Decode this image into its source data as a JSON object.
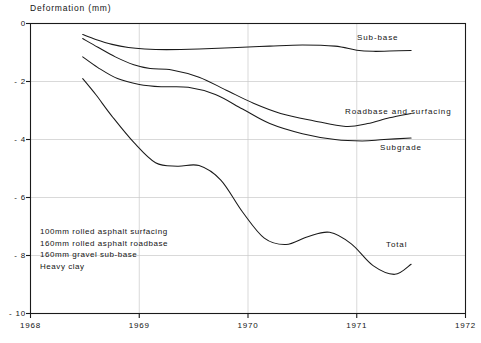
{
  "chart_data": {
    "type": "line",
    "title": "",
    "ylabel": "Deformation (mm)",
    "xlabel": "",
    "ylim": [
      -10,
      0
    ],
    "xlim": [
      1968,
      1972
    ],
    "yticks": [
      0,
      -2,
      -4,
      -6,
      -8,
      -10
    ],
    "ytick_labels": [
      "0",
      "- 2",
      "- 4",
      "- 6",
      "- 8",
      "- 10"
    ],
    "xticks": [
      1968,
      1969,
      1970,
      1971,
      1972
    ],
    "xtick_labels": [
      "1968",
      "1969",
      "1970",
      "1971",
      "1972"
    ],
    "grid": true,
    "legend_position": "inline-right-of-curve",
    "series": [
      {
        "name": "Sub-base",
        "label": "Sub-base",
        "x": [
          1968.48,
          1968.6,
          1968.75,
          1968.9,
          1969.05,
          1969.25,
          1969.55,
          1969.9,
          1970.2,
          1970.5,
          1970.8,
          1971.0,
          1971.15,
          1971.3,
          1971.5
        ],
        "y": [
          -0.38,
          -0.55,
          -0.72,
          -0.83,
          -0.88,
          -0.9,
          -0.88,
          -0.83,
          -0.78,
          -0.74,
          -0.78,
          -0.92,
          -0.96,
          -0.95,
          -0.93
        ]
      },
      {
        "name": "Roadbase and surfacing",
        "label": "Roadbase and surfacing",
        "x": [
          1968.48,
          1968.62,
          1968.78,
          1968.95,
          1969.1,
          1969.3,
          1969.55,
          1969.8,
          1970.05,
          1970.3,
          1970.6,
          1970.9,
          1971.1,
          1971.3,
          1971.5
        ],
        "y": [
          -0.52,
          -0.82,
          -1.15,
          -1.42,
          -1.55,
          -1.6,
          -1.85,
          -2.3,
          -2.75,
          -3.1,
          -3.35,
          -3.55,
          -3.45,
          -3.25,
          -3.1
        ]
      },
      {
        "name": "Subgrade",
        "label": "Subgrade",
        "x": [
          1968.48,
          1968.62,
          1968.8,
          1969.0,
          1969.2,
          1969.45,
          1969.7,
          1969.95,
          1970.2,
          1970.5,
          1970.8,
          1971.05,
          1971.25,
          1971.5
        ],
        "y": [
          -1.15,
          -1.52,
          -1.9,
          -2.1,
          -2.18,
          -2.2,
          -2.45,
          -2.95,
          -3.45,
          -3.8,
          -4.0,
          -4.05,
          -4.0,
          -3.95
        ]
      },
      {
        "name": "Total",
        "label": "Total",
        "x": [
          1968.48,
          1968.6,
          1968.75,
          1968.95,
          1969.15,
          1969.35,
          1969.55,
          1969.75,
          1969.95,
          1970.15,
          1970.35,
          1970.55,
          1970.75,
          1970.95,
          1971.15,
          1971.35,
          1971.5
        ],
        "y": [
          -1.9,
          -2.45,
          -3.2,
          -4.1,
          -4.8,
          -4.92,
          -4.9,
          -5.4,
          -6.5,
          -7.4,
          -7.62,
          -7.35,
          -7.2,
          -7.6,
          -8.35,
          -8.65,
          -8.3
        ]
      }
    ],
    "annotations": [
      {
        "name": "spec-line-1",
        "text": "100mm rolled asphalt surfacing"
      },
      {
        "name": "spec-line-2",
        "text": "160mm rolled asphalt roadbase"
      },
      {
        "name": "spec-line-3",
        "text": "160mm gravel sub-base"
      },
      {
        "name": "spec-line-4",
        "text": "Heavy clay"
      }
    ],
    "colors": {
      "line": "#1a1a1a",
      "axis": "#1a1a1a",
      "grid": "#c8c8c8",
      "background": "#ffffff"
    }
  }
}
